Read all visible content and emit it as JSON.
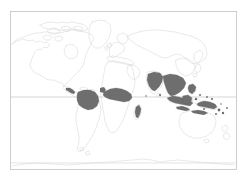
{
  "figure": {
    "type": "distribution-map",
    "projection": "equirectangular",
    "title": "",
    "caption": "",
    "background_color": "#ffffff",
    "frame": {
      "color": "#c9c9c9",
      "x": 10,
      "y": 11,
      "width": 227,
      "height": 159
    },
    "coastline_color": "#d2d2d2",
    "shading_color": "#6e6e6e",
    "legend": {
      "visible": false,
      "entries": []
    },
    "graticule": {
      "visible": true,
      "color": "#c4c4c4",
      "lines": [
        {
          "name": "equator",
          "y": 97,
          "color": "#c4c4c4"
        },
        {
          "name": "tropic-of-capricorn-lower",
          "y": 163,
          "color": "#d8d8d8"
        }
      ]
    },
    "shaded_regions": [
      {
        "name": "amazon-basin",
        "label": "Amazon Basin"
      },
      {
        "name": "central-america",
        "label": "Central America"
      },
      {
        "name": "central-africa",
        "label": "Central Africa"
      },
      {
        "name": "madagascar",
        "label": "Madagascar"
      },
      {
        "name": "south-asia",
        "label": "South Asia"
      },
      {
        "name": "southeast-asia",
        "label": "Southeast Asia"
      },
      {
        "name": "indonesia",
        "label": "Indonesian Archipelago"
      },
      {
        "name": "philippines",
        "label": "Philippines"
      },
      {
        "name": "new-guinea",
        "label": "New Guinea"
      },
      {
        "name": "melanesia",
        "label": "Melanesian Islands"
      },
      {
        "name": "northern-australia",
        "label": "Northern Australia"
      }
    ],
    "unshaded_landmasses": [
      {
        "name": "north-america",
        "label": "North America"
      },
      {
        "name": "greenland",
        "label": "Greenland"
      },
      {
        "name": "europe",
        "label": "Europe"
      },
      {
        "name": "northern-asia",
        "label": "Northern Asia"
      },
      {
        "name": "southern-south-america",
        "label": "Southern South America"
      },
      {
        "name": "southern-africa",
        "label": "Southern Africa"
      },
      {
        "name": "australia",
        "label": "Australia"
      },
      {
        "name": "new-zealand",
        "label": "New Zealand"
      },
      {
        "name": "antarctica",
        "label": "Antarctica"
      }
    ]
  }
}
